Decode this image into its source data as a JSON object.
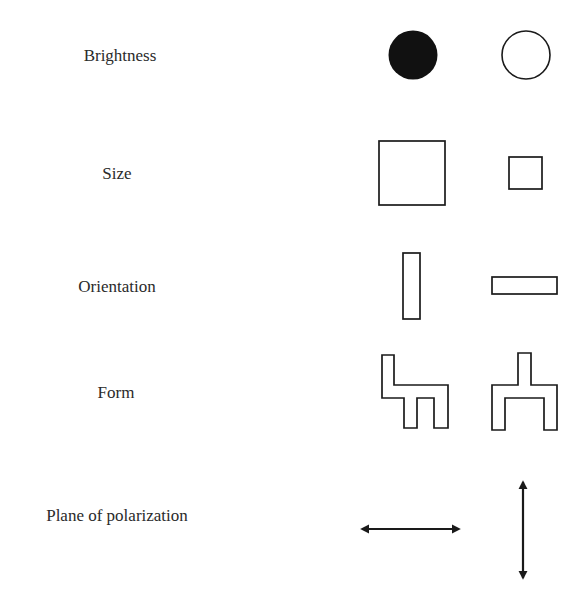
{
  "rows": [
    {
      "label": "Brightness",
      "left_item": "filled-circle",
      "right_item": "outline-circle"
    },
    {
      "label": "Size",
      "left_item": "large-square",
      "right_item": "small-square"
    },
    {
      "label": "Orientation",
      "left_item": "vertical-rectangle",
      "right_item": "horizontal-rectangle"
    },
    {
      "label": "Form",
      "left_item": "chair-shape",
      "right_item": "table-shape"
    },
    {
      "label": "Plane of polarization",
      "left_item": "horizontal-double-arrow",
      "right_item": "vertical-double-arrow"
    }
  ],
  "colors": {
    "stroke": "#1a1a1a",
    "fill_dark": "#111111",
    "text": "#2a2a2a",
    "background": "#ffffff"
  }
}
